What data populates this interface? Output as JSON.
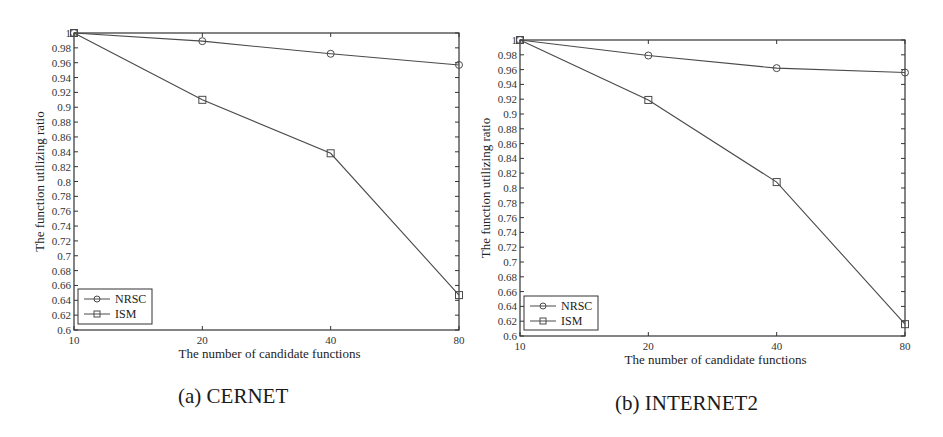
{
  "chart_data": [
    {
      "type": "line",
      "title": "(a) CERNET",
      "xlabel": "The number of candidate functions",
      "ylabel": "The function utilizing ratio",
      "categories": [
        "10",
        "20",
        "40",
        "80"
      ],
      "x": [
        10,
        20,
        40,
        80
      ],
      "ylim": [
        0.6,
        1.0
      ],
      "yticks": [
        0.6,
        0.62,
        0.64,
        0.66,
        0.68,
        0.7,
        0.72,
        0.74,
        0.76,
        0.78,
        0.8,
        0.82,
        0.84,
        0.86,
        0.88,
        0.9,
        0.92,
        0.94,
        0.96,
        0.98,
        1
      ],
      "ytick_labels": [
        "0.6",
        "0.62",
        "0.64",
        "0.66",
        "0.68",
        "0.7",
        "0.72",
        "0.74",
        "0.76",
        "0.78",
        "0.8",
        "0.82",
        "0.84",
        "0.86",
        "0.88",
        "0.9",
        "0.92",
        "0.94",
        "0.96",
        "0.98",
        "1"
      ],
      "grid": false,
      "legend_position": "lower left",
      "series": [
        {
          "name": "NRSC",
          "marker": "circle",
          "values": [
            1.0,
            0.989,
            0.972,
            0.957
          ]
        },
        {
          "name": "ISM",
          "marker": "square",
          "values": [
            1.0,
            0.91,
            0.838,
            0.647
          ]
        }
      ]
    },
    {
      "type": "line",
      "title": "(b) INTERNET2",
      "xlabel": "The number of candidate functions",
      "ylabel": "The function utilizing ratio",
      "categories": [
        "10",
        "20",
        "40",
        "80"
      ],
      "x": [
        10,
        20,
        40,
        80
      ],
      "ylim": [
        0.6,
        1.0
      ],
      "yticks": [
        0.6,
        0.62,
        0.64,
        0.66,
        0.68,
        0.7,
        0.72,
        0.74,
        0.76,
        0.78,
        0.8,
        0.82,
        0.84,
        0.86,
        0.88,
        0.9,
        0.92,
        0.94,
        0.96,
        0.98,
        1
      ],
      "ytick_labels": [
        "0.6",
        "0.62",
        "0.64",
        "0.66",
        "0.68",
        "0.7",
        "0.72",
        "0.74",
        "0.76",
        "0.78",
        "0.8",
        "0.82",
        "0.84",
        "0.86",
        "0.88",
        "0.9",
        "0.92",
        "0.94",
        "0.96",
        "0.98",
        "1"
      ],
      "grid": false,
      "legend_position": "lower left",
      "series": [
        {
          "name": "NRSC",
          "marker": "circle",
          "values": [
            1.0,
            0.979,
            0.962,
            0.956
          ]
        },
        {
          "name": "ISM",
          "marker": "square",
          "values": [
            1.0,
            0.919,
            0.808,
            0.616
          ]
        }
      ]
    }
  ],
  "captions": {
    "a": "(a) CERNET",
    "b": "(b) INTERNET2"
  },
  "colors": {
    "line": "#4a4a4a",
    "axis": "#333333",
    "background": "#ffffff"
  }
}
